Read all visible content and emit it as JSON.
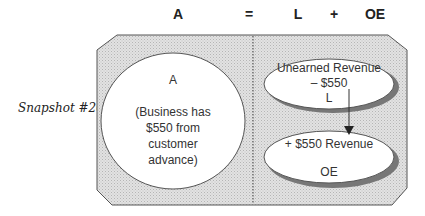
{
  "equation": {
    "assets": "A",
    "equals": "=",
    "liabilities": "L",
    "plus": "+",
    "owners_equity": "OE"
  },
  "snapshot_label": "Snapshot #20",
  "left_circle": {
    "title": "A",
    "line1": "(Business has",
    "line2": "$550 from",
    "line3": "customer",
    "line4": "advance)"
  },
  "upper_ellipse": {
    "line1": "Unearned Revenue",
    "line2": "– $550",
    "line3": "L"
  },
  "lower_ellipse": {
    "line1": "+ $550 Revenue",
    "line2": "OE"
  },
  "colors": {
    "panel_fill": "#d9d9d9",
    "shadow": "#777777",
    "stroke": "#555555"
  }
}
